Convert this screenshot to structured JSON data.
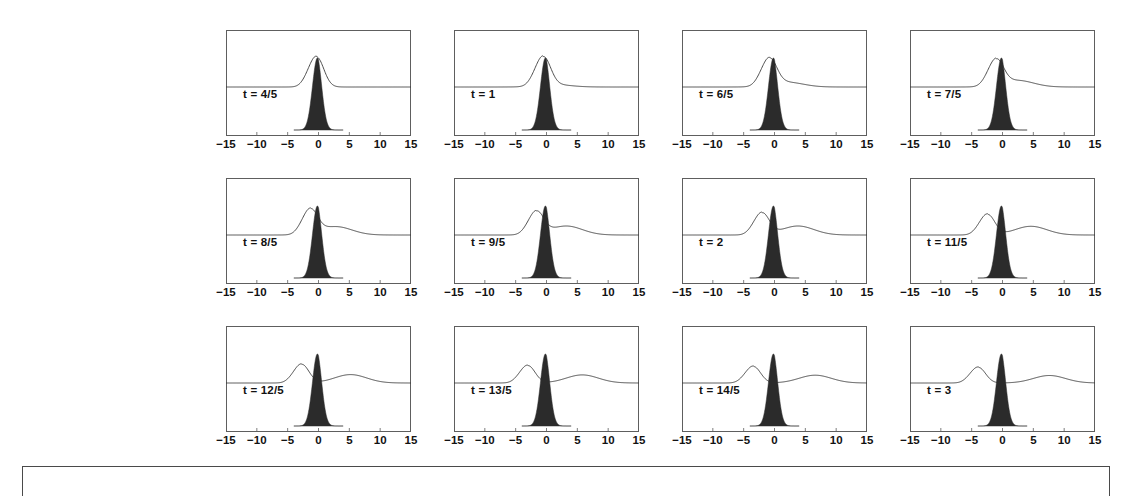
{
  "figure": {
    "layout": {
      "rows": 3,
      "cols": 4
    },
    "axis": {
      "tick_labels": [
        "−15",
        "−10",
        "−5",
        "0",
        "5",
        "10",
        "15"
      ],
      "tick_values": [
        -15,
        -10,
        -5,
        0,
        5,
        10,
        15
      ],
      "xlim": [
        -15,
        15
      ]
    },
    "colors": {
      "frame": "#5e5e5e",
      "curve": "#3a3a3a",
      "fill_peak": "#2b2b2b",
      "background": "#ffffff",
      "bottom_box_border": "#4a4a4a"
    },
    "bottom_box": {
      "label": "empty-caption-frame"
    }
  },
  "chart_data": {
    "type": "line",
    "title": "",
    "xlabel": "",
    "ylabel": "",
    "xlim": [
      -15,
      15
    ],
    "grid": false,
    "legend": null,
    "panels": [
      {
        "label": "t = 4/5",
        "t": 0.8,
        "series": [
          {
            "name": "upper-wave",
            "peak_x": -0.3,
            "peak_height": 1.0,
            "secondary_peak_x": null,
            "secondary_height": 0.0,
            "baseline": 0.0
          },
          {
            "name": "lower-peak",
            "peak_x": 0.0,
            "peak_height": 1.0,
            "filled": true
          }
        ]
      },
      {
        "label": "t = 1",
        "t": 1.0,
        "series": [
          {
            "name": "upper-wave",
            "peak_x": -0.5,
            "peak_height": 0.95,
            "secondary_peak_x": 1.2,
            "secondary_height": 0.08,
            "baseline": 0.0
          },
          {
            "name": "lower-peak",
            "peak_x": 0.0,
            "peak_height": 1.0,
            "filled": true
          }
        ]
      },
      {
        "label": "t = 6/5",
        "t": 1.2,
        "series": [
          {
            "name": "upper-wave",
            "peak_x": -0.8,
            "peak_height": 0.88,
            "secondary_peak_x": 2.0,
            "secondary_height": 0.16,
            "baseline": 0.0
          },
          {
            "name": "lower-peak",
            "peak_x": 0.0,
            "peak_height": 1.0,
            "filled": true
          }
        ]
      },
      {
        "label": "t = 7/5",
        "t": 1.4,
        "series": [
          {
            "name": "upper-wave",
            "peak_x": -1.0,
            "peak_height": 0.85,
            "secondary_peak_x": 2.4,
            "secondary_height": 0.22,
            "baseline": 0.0
          },
          {
            "name": "lower-peak",
            "peak_x": 0.0,
            "peak_height": 1.0,
            "filled": true
          }
        ]
      },
      {
        "label": "t = 8/5",
        "t": 1.6,
        "series": [
          {
            "name": "upper-wave",
            "peak_x": -1.3,
            "peak_height": 0.8,
            "secondary_peak_x": 2.8,
            "secondary_height": 0.28,
            "baseline": 0.0
          },
          {
            "name": "lower-peak",
            "peak_x": 0.0,
            "peak_height": 1.0,
            "filled": true
          }
        ]
      },
      {
        "label": "t = 9/5",
        "t": 1.8,
        "series": [
          {
            "name": "upper-wave",
            "peak_x": -1.6,
            "peak_height": 0.75,
            "secondary_peak_x": 3.2,
            "secondary_height": 0.3,
            "baseline": 0.0
          },
          {
            "name": "lower-peak",
            "peak_x": 0.0,
            "peak_height": 1.0,
            "filled": true
          }
        ]
      },
      {
        "label": "t = 2",
        "t": 2.0,
        "series": [
          {
            "name": "upper-wave",
            "peak_x": -2.0,
            "peak_height": 0.72,
            "secondary_peak_x": 3.8,
            "secondary_height": 0.3,
            "baseline": 0.0
          },
          {
            "name": "lower-peak",
            "peak_x": 0.0,
            "peak_height": 1.0,
            "filled": true
          }
        ]
      },
      {
        "label": "t = 11/5",
        "t": 2.2,
        "series": [
          {
            "name": "upper-wave",
            "peak_x": -2.4,
            "peak_height": 0.68,
            "secondary_peak_x": 4.6,
            "secondary_height": 0.29,
            "baseline": 0.0
          },
          {
            "name": "lower-peak",
            "peak_x": 0.0,
            "peak_height": 1.0,
            "filled": true
          }
        ]
      },
      {
        "label": "t = 12/5",
        "t": 2.4,
        "series": [
          {
            "name": "upper-wave",
            "peak_x": -2.7,
            "peak_height": 0.62,
            "secondary_peak_x": 5.2,
            "secondary_height": 0.28,
            "baseline": 0.0
          },
          {
            "name": "lower-peak",
            "peak_x": 0.0,
            "peak_height": 1.0,
            "filled": true
          }
        ]
      },
      {
        "label": "t = 13/5",
        "t": 2.6,
        "series": [
          {
            "name": "upper-wave",
            "peak_x": -3.0,
            "peak_height": 0.58,
            "secondary_peak_x": 5.8,
            "secondary_height": 0.27,
            "baseline": 0.0
          },
          {
            "name": "lower-peak",
            "peak_x": 0.0,
            "peak_height": 1.0,
            "filled": true
          }
        ]
      },
      {
        "label": "t = 14/5",
        "t": 2.8,
        "series": [
          {
            "name": "upper-wave",
            "peak_x": -3.4,
            "peak_height": 0.55,
            "secondary_peak_x": 6.6,
            "secondary_height": 0.26,
            "baseline": 0.0
          },
          {
            "name": "lower-peak",
            "peak_x": 0.0,
            "peak_height": 1.0,
            "filled": true
          }
        ]
      },
      {
        "label": "t = 3",
        "t": 3.0,
        "series": [
          {
            "name": "upper-wave",
            "peak_x": -3.9,
            "peak_height": 0.52,
            "secondary_peak_x": 7.6,
            "secondary_height": 0.25,
            "baseline": 0.0
          },
          {
            "name": "lower-peak",
            "peak_x": 0.0,
            "peak_height": 1.0,
            "filled": true
          }
        ]
      }
    ]
  }
}
